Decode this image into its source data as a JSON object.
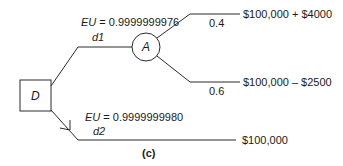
{
  "diagram": {
    "type": "decision-tree",
    "caption": "(c)",
    "decision_node": {
      "label": "D",
      "shape": "square"
    },
    "chance_node": {
      "label": "A",
      "shape": "circle"
    },
    "branches": {
      "d1": {
        "name": "d1",
        "eu_label": "EU = 0.9999999976",
        "eu_prefix": "EU",
        "eu_value": "= 0.9999999976",
        "leads_to": "A"
      },
      "d2": {
        "name": "d2",
        "eu_label": "EU = 0.9999999980",
        "eu_prefix": "EU",
        "eu_value": "= 0.9999999980",
        "outcome": "$100,000",
        "chosen": true
      }
    },
    "chance_outcomes": [
      {
        "probability": "0.4",
        "outcome": "$100,000 + $4000"
      },
      {
        "probability": "0.6",
        "outcome": "$100,000 – $2500"
      }
    ],
    "colors": {
      "line": "#2a2a2a",
      "text": "#1a1a1a",
      "background": "#ffffff"
    }
  }
}
